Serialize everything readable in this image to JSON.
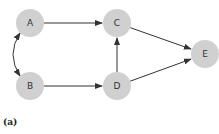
{
  "diagram": {
    "type": "directed-graph",
    "node_color": "#d0d0d0",
    "edge_color": "#333333",
    "nodes": [
      {
        "id": "A",
        "label": "A"
      },
      {
        "id": "B",
        "label": "B"
      },
      {
        "id": "C",
        "label": "C"
      },
      {
        "id": "D",
        "label": "D"
      },
      {
        "id": "E",
        "label": "E"
      }
    ],
    "edges": [
      {
        "from": "A",
        "to": "C",
        "style": "straight"
      },
      {
        "from": "B",
        "to": "D",
        "style": "straight"
      },
      {
        "from": "D",
        "to": "C",
        "style": "straight"
      },
      {
        "from": "C",
        "to": "E",
        "style": "straight"
      },
      {
        "from": "D",
        "to": "E",
        "style": "straight"
      },
      {
        "from": "A",
        "to": "B",
        "style": "curved",
        "bidirectional": true
      }
    ]
  },
  "caption": "(a)"
}
